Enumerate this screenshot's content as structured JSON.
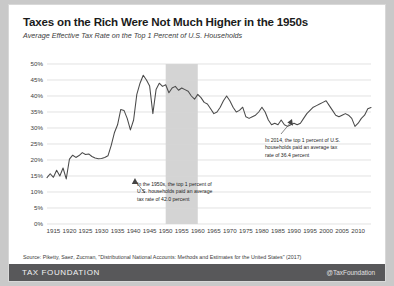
{
  "title": "Taxes on the Rich Were Not Much Higher in the 1950s",
  "subtitle": "Average Effective Tax Rate on the Top 1 Percent of U.S. Households",
  "source": "Source: Piketty, Saez, Zucman, \"Distributional National Accounts: Methods and Estimates for the United States\" (2017)",
  "footer": {
    "brand": "TAX FOUNDATION",
    "handle": "@TaxFoundation"
  },
  "annotations": [
    {
      "id": "anno-1950s",
      "text": "In the 1950s, the top 1 percent of U.S. households paid an average tax rate of 42.0 percent"
    },
    {
      "id": "anno-2014",
      "text": "In 2014, the top 1 percent of U.S. households paid an average tax rate of 36.4 percent"
    }
  ],
  "chart_data": {
    "type": "line",
    "title": "Taxes on the Rich Were Not Much Higher in the 1950s",
    "subtitle": "Average Effective Tax Rate on the Top 1 Percent of U.S. Households",
    "xlabel": "",
    "ylabel": "",
    "xlim": [
      1913,
      2014
    ],
    "ylim": [
      0,
      50
    ],
    "ytick_labels": [
      "0%",
      "5%",
      "10%",
      "15%",
      "20%",
      "25%",
      "30%",
      "35%",
      "40%",
      "45%",
      "50%"
    ],
    "ytick_values": [
      0,
      5,
      10,
      15,
      20,
      25,
      30,
      35,
      40,
      45,
      50
    ],
    "xtick_values": [
      1915,
      1920,
      1925,
      1930,
      1935,
      1940,
      1945,
      1950,
      1955,
      1960,
      1965,
      1970,
      1975,
      1980,
      1985,
      1990,
      1995,
      2000,
      2005,
      2010
    ],
    "grid": "horizontal",
    "legend": "none",
    "line_color": "#4a4a4a",
    "highlight_band": {
      "label": "1950s",
      "x_start": 1950,
      "x_end": 1960,
      "color": "#cccccc"
    },
    "x": [
      1913,
      1914,
      1915,
      1916,
      1917,
      1918,
      1919,
      1920,
      1921,
      1922,
      1923,
      1924,
      1925,
      1926,
      1927,
      1928,
      1929,
      1930,
      1931,
      1932,
      1933,
      1934,
      1935,
      1936,
      1937,
      1938,
      1939,
      1940,
      1941,
      1942,
      1943,
      1944,
      1945,
      1946,
      1947,
      1948,
      1949,
      1950,
      1951,
      1952,
      1953,
      1954,
      1955,
      1956,
      1957,
      1958,
      1959,
      1960,
      1961,
      1962,
      1963,
      1964,
      1965,
      1966,
      1967,
      1968,
      1969,
      1970,
      1971,
      1972,
      1973,
      1974,
      1975,
      1976,
      1977,
      1978,
      1979,
      1980,
      1981,
      1982,
      1983,
      1984,
      1985,
      1986,
      1987,
      1988,
      1989,
      1990,
      1991,
      1992,
      1993,
      1994,
      1995,
      1996,
      1997,
      1998,
      1999,
      2000,
      2001,
      2002,
      2003,
      2004,
      2005,
      2006,
      2007,
      2008,
      2009,
      2010,
      2011,
      2012,
      2013,
      2014
    ],
    "values": [
      14.5,
      15.7,
      14.6,
      16.8,
      15.0,
      17.5,
      14.1,
      20.3,
      21.5,
      20.8,
      21.4,
      22.3,
      21.7,
      21.9,
      21.1,
      20.6,
      20.4,
      20.5,
      20.8,
      21.3,
      24.5,
      28.5,
      31.0,
      35.8,
      35.5,
      33.0,
      29.4,
      32.5,
      40.5,
      44.0,
      46.5,
      45.0,
      43.1,
      34.5,
      42.0,
      44.0,
      43.0,
      43.5,
      41.0,
      42.5,
      43.0,
      41.8,
      42.5,
      42.0,
      41.5,
      40.0,
      39.0,
      40.5,
      39.5,
      38.0,
      37.5,
      36.0,
      34.5,
      35.0,
      36.5,
      38.5,
      40.0,
      38.5,
      36.5,
      35.0,
      35.5,
      36.5,
      33.5,
      33.0,
      33.5,
      34.0,
      35.0,
      36.5,
      35.0,
      32.5,
      31.0,
      31.5,
      31.0,
      32.5,
      31.0,
      30.5,
      31.0,
      31.5,
      31.0,
      31.5,
      33.0,
      34.5,
      35.5,
      36.5,
      37.0,
      37.5,
      38.0,
      38.5,
      37.0,
      35.5,
      34.0,
      33.5,
      34.0,
      34.5,
      34.0,
      33.0,
      30.5,
      31.5,
      33.0,
      34.0,
      36.0,
      36.4
    ]
  }
}
